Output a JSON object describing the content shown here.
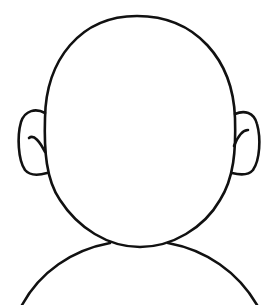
{
  "figure": {
    "stroke_color": "#111111",
    "background": "#ffffff",
    "parts": [
      "head",
      "left-ear",
      "right-ear",
      "shoulders"
    ]
  }
}
